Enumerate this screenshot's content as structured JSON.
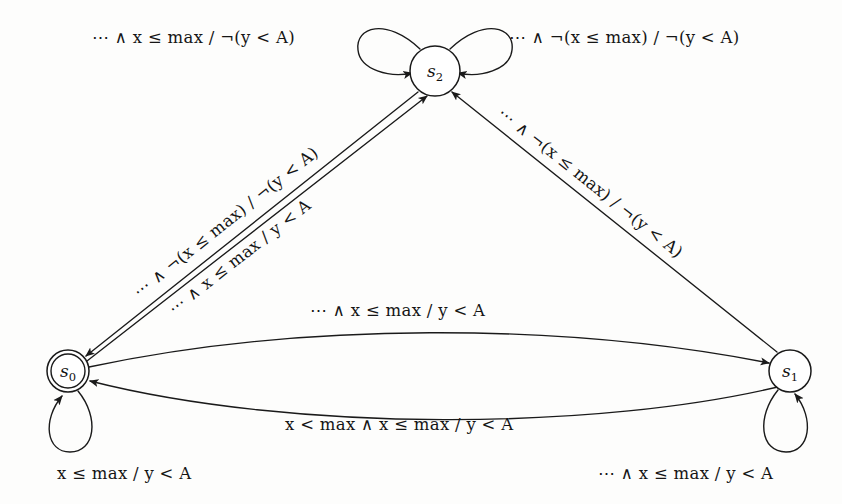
{
  "diagram": {
    "kind": "finite-state-machine",
    "background_color": "#fdfdfc",
    "ink_color": "#1a1a1a"
  },
  "states": [
    {
      "id": "s0",
      "label": "s",
      "subscript": "0",
      "shape": "double-circle",
      "role": "initial-accepting",
      "cx": 68,
      "cy": 371,
      "r": 21
    },
    {
      "id": "s1",
      "label": "s",
      "subscript": "1",
      "shape": "circle",
      "role": "normal",
      "cx": 790,
      "cy": 371,
      "r": 21
    },
    {
      "id": "s2",
      "label": "s",
      "subscript": "2",
      "shape": "circle",
      "role": "normal",
      "cx": 435,
      "cy": 71,
      "r": 25
    }
  ],
  "transitions": [
    {
      "id": "t-s2-loop-left",
      "from": "s2",
      "to": "s2",
      "kind": "self-loop",
      "side": "left",
      "label_id": "lbl-top-left"
    },
    {
      "id": "t-s2-loop-right",
      "from": "s2",
      "to": "s2",
      "kind": "self-loop",
      "side": "right",
      "label_id": "lbl-top-right"
    },
    {
      "id": "t-s2-to-s0",
      "from": "s2",
      "to": "s0",
      "kind": "straight",
      "label_id": "lbl-left-upper"
    },
    {
      "id": "t-s0-to-s2",
      "from": "s0",
      "to": "s2",
      "kind": "straight",
      "label_id": "lbl-left-lower"
    },
    {
      "id": "t-s1-to-s2",
      "from": "s1",
      "to": "s2",
      "kind": "straight",
      "label_id": "lbl-right"
    },
    {
      "id": "t-s0-to-s1",
      "from": "s0",
      "to": "s1",
      "kind": "curve-upper",
      "label_id": "lbl-mid"
    },
    {
      "id": "t-s1-to-s0",
      "from": "s1",
      "to": "s0",
      "kind": "curve-lower",
      "label_id": "lbl-lower"
    },
    {
      "id": "t-s0-loop",
      "from": "s0",
      "to": "s0",
      "kind": "self-loop",
      "side": "bottom",
      "label_id": "lbl-bottom-left"
    },
    {
      "id": "t-s1-loop",
      "from": "s1",
      "to": "s1",
      "kind": "self-loop",
      "side": "bottom",
      "label_id": "lbl-bottom-right"
    }
  ],
  "labels": {
    "top_left": "⋯ ∧ x ≤ max / ¬(y < A)",
    "top_right": "⋯ ∧ ¬(x ≤ max) / ¬(y < A)",
    "left_upper": "⋯ ∧ ¬(x ≤ max) / ¬(y < A)",
    "left_lower": "⋯ ∧ x ≤ max / y < A",
    "right_diagonal": "⋯ ∧ ¬(x ≤ max) / ¬(y < A)",
    "middle": "⋯ ∧ x ≤ max / y < A",
    "lower_middle": "x < max ∧ x ≤ max / y < A",
    "bottom_left": "x ≤ max / y < A",
    "bottom_right": "⋯ ∧ x ≤ max / y < A"
  }
}
